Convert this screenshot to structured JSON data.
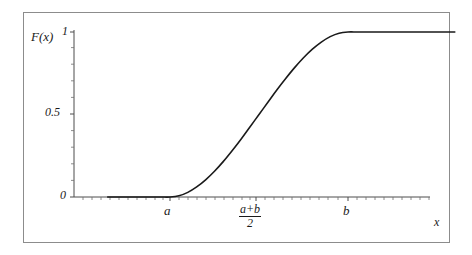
{
  "figure": {
    "kind": "line-plot",
    "background_color": "#ffffff",
    "frame_color": "#8c8c8c",
    "curve_color": "#1a1a1a",
    "axis_color": "#4d4d4d"
  },
  "axes": {
    "y_axis_label": "F(x)",
    "x_axis_label": "x",
    "y_ticks": [
      {
        "label": "0",
        "value": 0
      },
      {
        "label": "0.5",
        "value": 0.5
      },
      {
        "label": "1",
        "value": 1
      }
    ],
    "x_ticks": [
      {
        "label": "a"
      },
      {
        "label": "b"
      }
    ],
    "x_tick_fraction": {
      "numerator": "a+b",
      "denominator": "2"
    }
  },
  "chart_data": {
    "type": "line",
    "title": "",
    "subtitle": "",
    "xlabel": "x",
    "ylabel": "F(x)",
    "xlim": [
      -0.35,
      1.6
    ],
    "ylim": [
      0,
      1
    ],
    "grid": false,
    "legend": null,
    "annotations": [],
    "x_tick_labels": [
      "a",
      "(a+b)/2",
      "b"
    ],
    "x_tick_values": [
      0,
      0.5,
      1
    ],
    "y_tick_labels": [
      "0",
      "0.5",
      "1"
    ],
    "y_tick_values": [
      0,
      0.5,
      1
    ],
    "series": [
      {
        "name": "F(x)",
        "x": [
          -0.35,
          -0.3,
          -0.25,
          -0.2,
          -0.15,
          -0.1,
          -0.05,
          0.0,
          0.05,
          0.1,
          0.15,
          0.2,
          0.25,
          0.3,
          0.35,
          0.4,
          0.45,
          0.5,
          0.55,
          0.6,
          0.65,
          0.7,
          0.75,
          0.8,
          0.85,
          0.9,
          0.95,
          1.0,
          1.05,
          1.1,
          1.2,
          1.3,
          1.4,
          1.5,
          1.6
        ],
        "y": [
          0.0,
          0.0,
          0.0,
          0.0,
          0.0,
          0.0,
          0.0,
          0.0,
          0.007,
          0.028,
          0.061,
          0.104,
          0.156,
          0.216,
          0.282,
          0.352,
          0.426,
          0.5,
          0.574,
          0.648,
          0.718,
          0.784,
          0.844,
          0.896,
          0.939,
          0.972,
          0.993,
          1.0,
          1.0,
          1.0,
          1.0,
          1.0,
          1.0,
          1.0,
          1.0
        ]
      }
    ]
  }
}
